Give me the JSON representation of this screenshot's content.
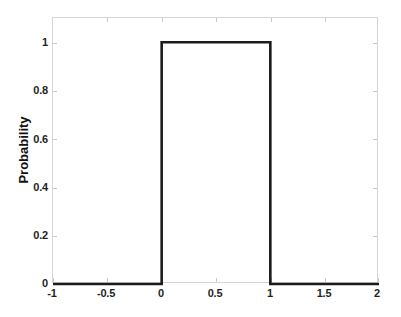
{
  "chart_data": {
    "type": "line",
    "title": "",
    "subtitle": "",
    "xlabel": "",
    "ylabel": "Probability",
    "xlim": [
      -1,
      2
    ],
    "ylim": [
      0,
      1.1
    ],
    "grid": false,
    "legend": null,
    "legend_position": "none",
    "annotations": [],
    "xticks": [
      -1,
      -0.5,
      0,
      0.5,
      1,
      1.5,
      2
    ],
    "xtick_labels": [
      "-1",
      "-0.5",
      "0",
      "0.5",
      "1",
      "1.5",
      "2"
    ],
    "yticks": [
      0,
      0.2,
      0.4,
      0.6,
      0.8,
      1
    ],
    "ytick_labels": [
      "0",
      "0.2",
      "0.4",
      "0.6",
      "0.8",
      "1"
    ],
    "series": [
      {
        "name": "Uniform probability density",
        "line_color": "#1c1c1c",
        "line_width": 2.6,
        "x": [
          -1,
          0,
          0,
          1,
          1,
          2
        ],
        "y": [
          0,
          0,
          1,
          1,
          0,
          0
        ]
      }
    ]
  },
  "axes": {
    "box_color": "#d6d6d6",
    "tick_color": "#c9c9c9",
    "tick_label_color": "#1f1f1f",
    "background": "#ffffff"
  }
}
